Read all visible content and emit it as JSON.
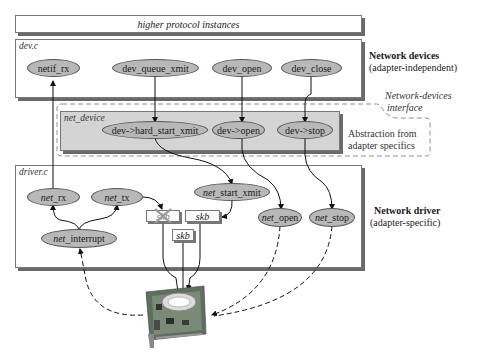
{
  "diagram": {
    "top_bar": {
      "label": "higher protocol instances"
    },
    "dev_c": {
      "label": "dev.c",
      "nodes": [
        "netif_rx",
        "dev_queue_xmit",
        "dev_open",
        "dev_close"
      ],
      "side_title": "Network devices",
      "side_subtitle": "(adapter-independent)"
    },
    "interface": {
      "label_line1": "Network-devices",
      "label_line2": "interface",
      "abstraction_line1": "Abstraction from",
      "abstraction_line2": "adapter specifics"
    },
    "net_device": {
      "label": "net_device",
      "nodes": [
        "dev->hard_start_xmit",
        "dev->open",
        "dev->stop"
      ]
    },
    "driver_c": {
      "label": "driver.c",
      "nodes": {
        "net_rx": {
          "prefix": "net",
          "suffix": "_rx"
        },
        "net_tx": {
          "prefix": "net",
          "suffix": "_tx"
        },
        "net_start_xmit": {
          "prefix": "net",
          "suffix": "_start_xmit"
        },
        "net_interrupt": {
          "prefix": "net",
          "suffix": "_interrupt"
        },
        "net_open": {
          "prefix": "net",
          "suffix": "_open"
        },
        "net_stop": {
          "prefix": "net",
          "suffix": "_stop"
        }
      },
      "buffers": [
        "skb",
        "skb",
        "skb"
      ],
      "side_title": "Network driver",
      "side_subtitle": "(adapter-specific)"
    },
    "hardware": {
      "name": "network adapter card"
    },
    "colors": {
      "node_fill": "#b8b8b8",
      "net_device_fill": "#d4d4d4",
      "shadow": "#6a6a6a"
    }
  }
}
